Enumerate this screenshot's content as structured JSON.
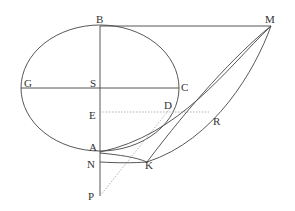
{
  "diagram": {
    "type": "geometric-construction",
    "labels": {
      "B": "B",
      "M": "M",
      "G": "G",
      "S": "S",
      "C": "C",
      "E": "E",
      "D": "D",
      "R": "R",
      "A": "A",
      "N": "N",
      "K": "K",
      "P": "P"
    },
    "colors": {
      "line": "#444444",
      "dotted": "#aaaaaa",
      "text": "#333333"
    },
    "shapes": [
      "ellipse centered at S with horizontal axis G–C and vertical axis B–A",
      "horizontal line B–M tangent at top of ellipse",
      "vertical line through B, S, E, A, N, P",
      "horizontal line G–S–C",
      "dotted horizontal line E–D–R",
      "curve from M through D region to A",
      "line from M to K",
      "curve from M through R to K and on to N",
      "dotted line from P toward D"
    ]
  }
}
